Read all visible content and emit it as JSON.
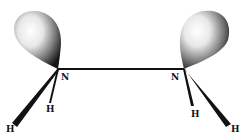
{
  "diagram": {
    "type": "molecular-orbital-diagram",
    "molecule": "N2H4 lone pairs (hydrazine-like)",
    "atoms": [
      {
        "id": "N1",
        "label": "N",
        "x": 58,
        "y": 69,
        "label_x": 61,
        "label_y": 80
      },
      {
        "id": "N2",
        "label": "N",
        "x": 184,
        "y": 69,
        "label_x": 172,
        "label_y": 80
      },
      {
        "id": "H1",
        "label": "H",
        "x": 50,
        "y": 108,
        "label_x": 46,
        "label_y": 111
      },
      {
        "id": "H2",
        "label": "H",
        "x": 12,
        "y": 125,
        "label_x": 6,
        "label_y": 131
      },
      {
        "id": "H3",
        "label": "H",
        "x": 192,
        "y": 110,
        "label_x": 191,
        "label_y": 116
      },
      {
        "id": "H4",
        "label": "H",
        "x": 228,
        "y": 126,
        "label_x": 230,
        "label_y": 131
      }
    ],
    "bonds": [
      {
        "from": "N1",
        "to": "N2",
        "style": "line"
      },
      {
        "from": "N1",
        "to": "H1",
        "style": "wedge-thin"
      },
      {
        "from": "N1",
        "to": "H2",
        "style": "wedge"
      },
      {
        "from": "N2",
        "to": "H3",
        "style": "wedge-thin"
      },
      {
        "from": "N2",
        "to": "H4",
        "style": "wedge"
      }
    ],
    "lobes": [
      {
        "atom": "N1",
        "direction": "up-left"
      },
      {
        "atom": "N2",
        "direction": "up-right"
      }
    ],
    "colors": {
      "ink": "#111111",
      "lobe_highlight": "#ffffff",
      "lobe_shadow": "#1a1a1a"
    }
  }
}
